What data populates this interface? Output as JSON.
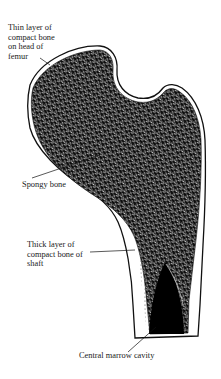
{
  "figure": {
    "colors": {
      "ink": "#111111",
      "paper": "#ffffff",
      "cortex": "#ffffff",
      "marrow": "#000000"
    }
  },
  "labels": [
    {
      "id": "thin-layer",
      "text": "Thin layer of\ncompact bone\non head of\nfemur"
    },
    {
      "id": "spongy",
      "text": "Spongy bone"
    },
    {
      "id": "thick-layer",
      "text": "Thick layer of\ncompact bone of\nshaft"
    },
    {
      "id": "marrow",
      "text": "Central marrow cavity"
    }
  ]
}
